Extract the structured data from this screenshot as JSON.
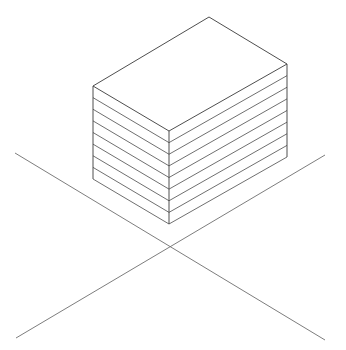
{
  "diagram": {
    "type": "isometric-stacked-box",
    "background": "#ffffff",
    "line_color": "#3a3a3a",
    "ground_color": "#6e6e6e",
    "box": {
      "top_vertex": [
        209,
        17
      ],
      "right_vertex": [
        287,
        64
      ],
      "front_vertex": [
        169,
        131
      ],
      "left_vertex": [
        93,
        86
      ],
      "height": 93,
      "layers": 8
    },
    "ground_axes": [
      {
        "from": [
          15,
          153
        ],
        "to": [
          325,
          340
        ]
      },
      {
        "from": [
          325,
          155
        ],
        "to": [
          16,
          338
        ]
      }
    ]
  }
}
